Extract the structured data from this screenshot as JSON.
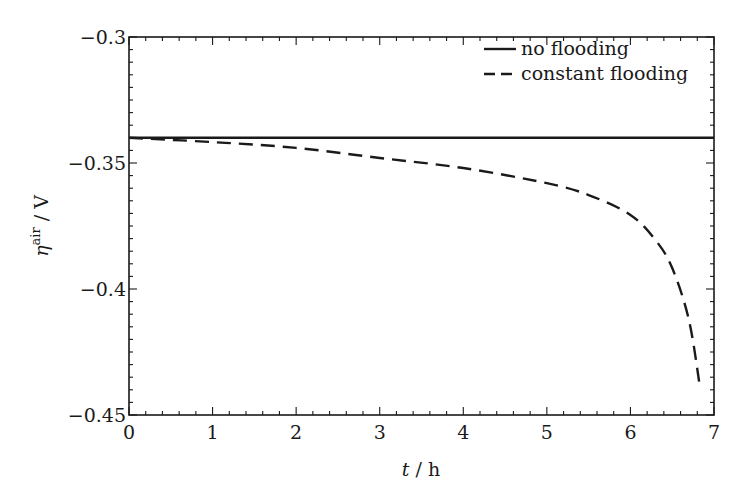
{
  "chart_data": {
    "type": "line",
    "title": "",
    "xlabel": "t / h",
    "ylabel": "η^air / V",
    "xlabel_parts": {
      "var": "t",
      "unit": " / h"
    },
    "ylabel_parts": {
      "var": "η",
      "sup": "air",
      "unit": " / V"
    },
    "xlim": [
      0,
      7
    ],
    "ylim": [
      -0.45,
      -0.3
    ],
    "xticks": [
      0,
      1,
      2,
      3,
      4,
      5,
      6,
      7
    ],
    "xtick_labels": [
      "0",
      "1",
      "2",
      "3",
      "4",
      "5",
      "6",
      "7"
    ],
    "yticks": [
      -0.3,
      -0.35,
      -0.4,
      -0.45
    ],
    "ytick_labels": [
      "−0.3",
      "−0.35",
      "−0.4",
      "−0.45"
    ],
    "grid": false,
    "legend_position": "upper right",
    "series": [
      {
        "name": "no flooding",
        "style": "solid",
        "color": "#1a1a1a",
        "x": [
          0,
          7
        ],
        "y": [
          -0.34,
          -0.34
        ]
      },
      {
        "name": "constant flooding",
        "style": "dashed",
        "color": "#1a1a1a",
        "x": [
          0,
          1,
          2,
          3,
          4,
          5,
          5.5,
          6,
          6.3,
          6.5,
          6.7,
          6.83
        ],
        "y": [
          -0.34,
          -0.3417,
          -0.344,
          -0.348,
          -0.352,
          -0.358,
          -0.3627,
          -0.3706,
          -0.3806,
          -0.3917,
          -0.4123,
          -0.4385
        ]
      }
    ]
  }
}
